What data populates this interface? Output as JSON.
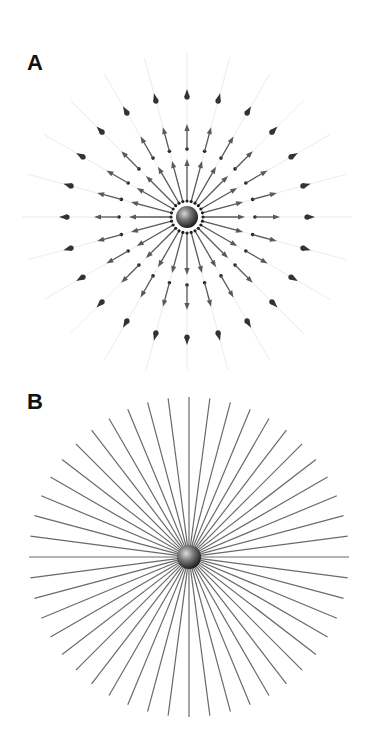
{
  "figure": {
    "panels": [
      {
        "label": "A",
        "description": "Electric field of a point charge shown as field vectors (arrows) radiating outward",
        "center": [
          187,
          217
        ],
        "sphere_radius": 11,
        "dot_ring_radius": 16,
        "directions": 24,
        "inner_arrow": {
          "start_r": 17,
          "end_r": 58
        },
        "middle_arrow": {
          "start_r": 68,
          "end_r": 93
        },
        "outer_arrowhead_r": 124,
        "faint_line_r": 165,
        "colors": {
          "arrow": "#5a5a5a",
          "dot": "#222222",
          "outer_head": "#333333",
          "faint_line": "#ececec"
        }
      },
      {
        "label": "B",
        "description": "Electric field of a point charge shown as field lines radiating outward",
        "center": [
          189,
          187
        ],
        "sphere_radius": 12,
        "line_count": 48,
        "line_radius": 160,
        "colors": {
          "line": "#6a6a6a"
        }
      }
    ]
  }
}
